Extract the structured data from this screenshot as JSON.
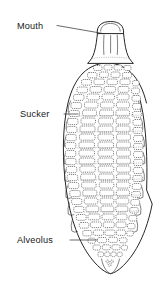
{
  "figure": {
    "background_color": "#ffffff",
    "ink_color": "#262626",
    "width": 158,
    "height": 288
  },
  "labels": [
    {
      "id": "mouth",
      "text": "Mouth",
      "text_x": 17,
      "text_y": 29,
      "leader": "M 57 25.5 L 103 33.5",
      "icon": "leader-line-icon"
    },
    {
      "id": "sucker",
      "text": "Sucker",
      "text_x": 20,
      "text_y": 117,
      "leader": "M 64 114 L 78 114",
      "icon": "leader-line-icon"
    },
    {
      "id": "alveolus",
      "text": "Alveolus",
      "text_x": 17,
      "text_y": 243,
      "leader": "M 70 240 L 97 240",
      "icon": "leader-line-icon"
    }
  ],
  "anatomy": {
    "mouth_cap": "M 97.5 33.5 C 97.0 25.5 102.0 21.5 110.5 21.4 C 119.0 21.3 124.0 25.3 123.8 33.3 Z",
    "neck": "M 96.5 33.6 C 95.6 40.5 94.8 47.5 92.8 54.0 C 91.4 58.5 89.0 61.0 86.5 63.2 L 134.5 63.2 C 132.0 60.8 129.8 58.2 128.4 54.0 C 126.4 47.6 125.4 40.6 124.6 33.4 Z",
    "neck_fold_left": "M 104.5 35.5 C 104.2 42.5 103.9 49.0 104.4 55.0",
    "neck_fold_right": "M 117.0 35.5 C 117.3 42.5 117.5 49.0 117.0 55.0",
    "neck_fold_mid": "M 110.7 36.2 L 110.7 54.0",
    "body_outline": "M 110.5 62.0 C 98.0 62.0 86.0 66.5 78.0 76.0 C 69.5 86.0 64.0 101.0 62.2 120.0 C 60.4 139.0 61.2 160.0 64.2 180.0 C 67.2 200.0 72.0 219.0 79.5 236.0 C 86.0 250.5 93.5 261.5 100.0 268.5 C 103.5 272.3 107.0 274.5 110.5 274.8 C 114.0 274.5 117.5 272.3 121.0 268.5 C 127.5 261.5 135.0 250.5 141.5 236.0 C 149.0 219.0 153.8 200.0 156.8 180.0 C 158.0 170.0 158.2 158.0 157.2 146.0 C 156.0 128.0 152.0 108.0 145.0 92.0 C 138.0 76.5 126.0 66.5 114.5 63.0 Z",
    "tail_tip": "M 104.0 266.0 C 105.5 270.5 108.0 274.0 110.5 275.5 C 113.0 274.0 115.5 270.5 117.0 266.0",
    "description": "Oval sucker bearing transverse rows of rectangular alveoli arranged in longitudinal columns",
    "alveoli_row_count": 25,
    "alveoli_column_count": 5
  }
}
